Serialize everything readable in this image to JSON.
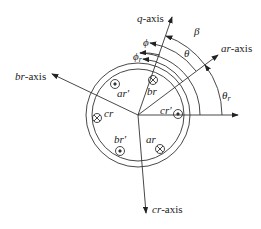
{
  "diagram": {
    "axes": {
      "q": {
        "var": "q",
        "suffix": "-axis"
      },
      "ar": {
        "var": "ar",
        "suffix": "-axis"
      },
      "br": {
        "var": "br",
        "suffix": "-axis"
      },
      "cr": {
        "var": "cr",
        "suffix": "-axis"
      }
    },
    "angles": {
      "beta": "β",
      "theta": "θ",
      "phi": "ϕ",
      "phi_r": "ϕ",
      "phi_r_sub": "r",
      "theta_r": "θ",
      "theta_r_sub": "r"
    },
    "conductors": {
      "ar_prime": "ar′",
      "br": "br",
      "cr_prime": "cr′",
      "cr": "cr",
      "br_prime": "br′",
      "ar": "ar"
    }
  }
}
